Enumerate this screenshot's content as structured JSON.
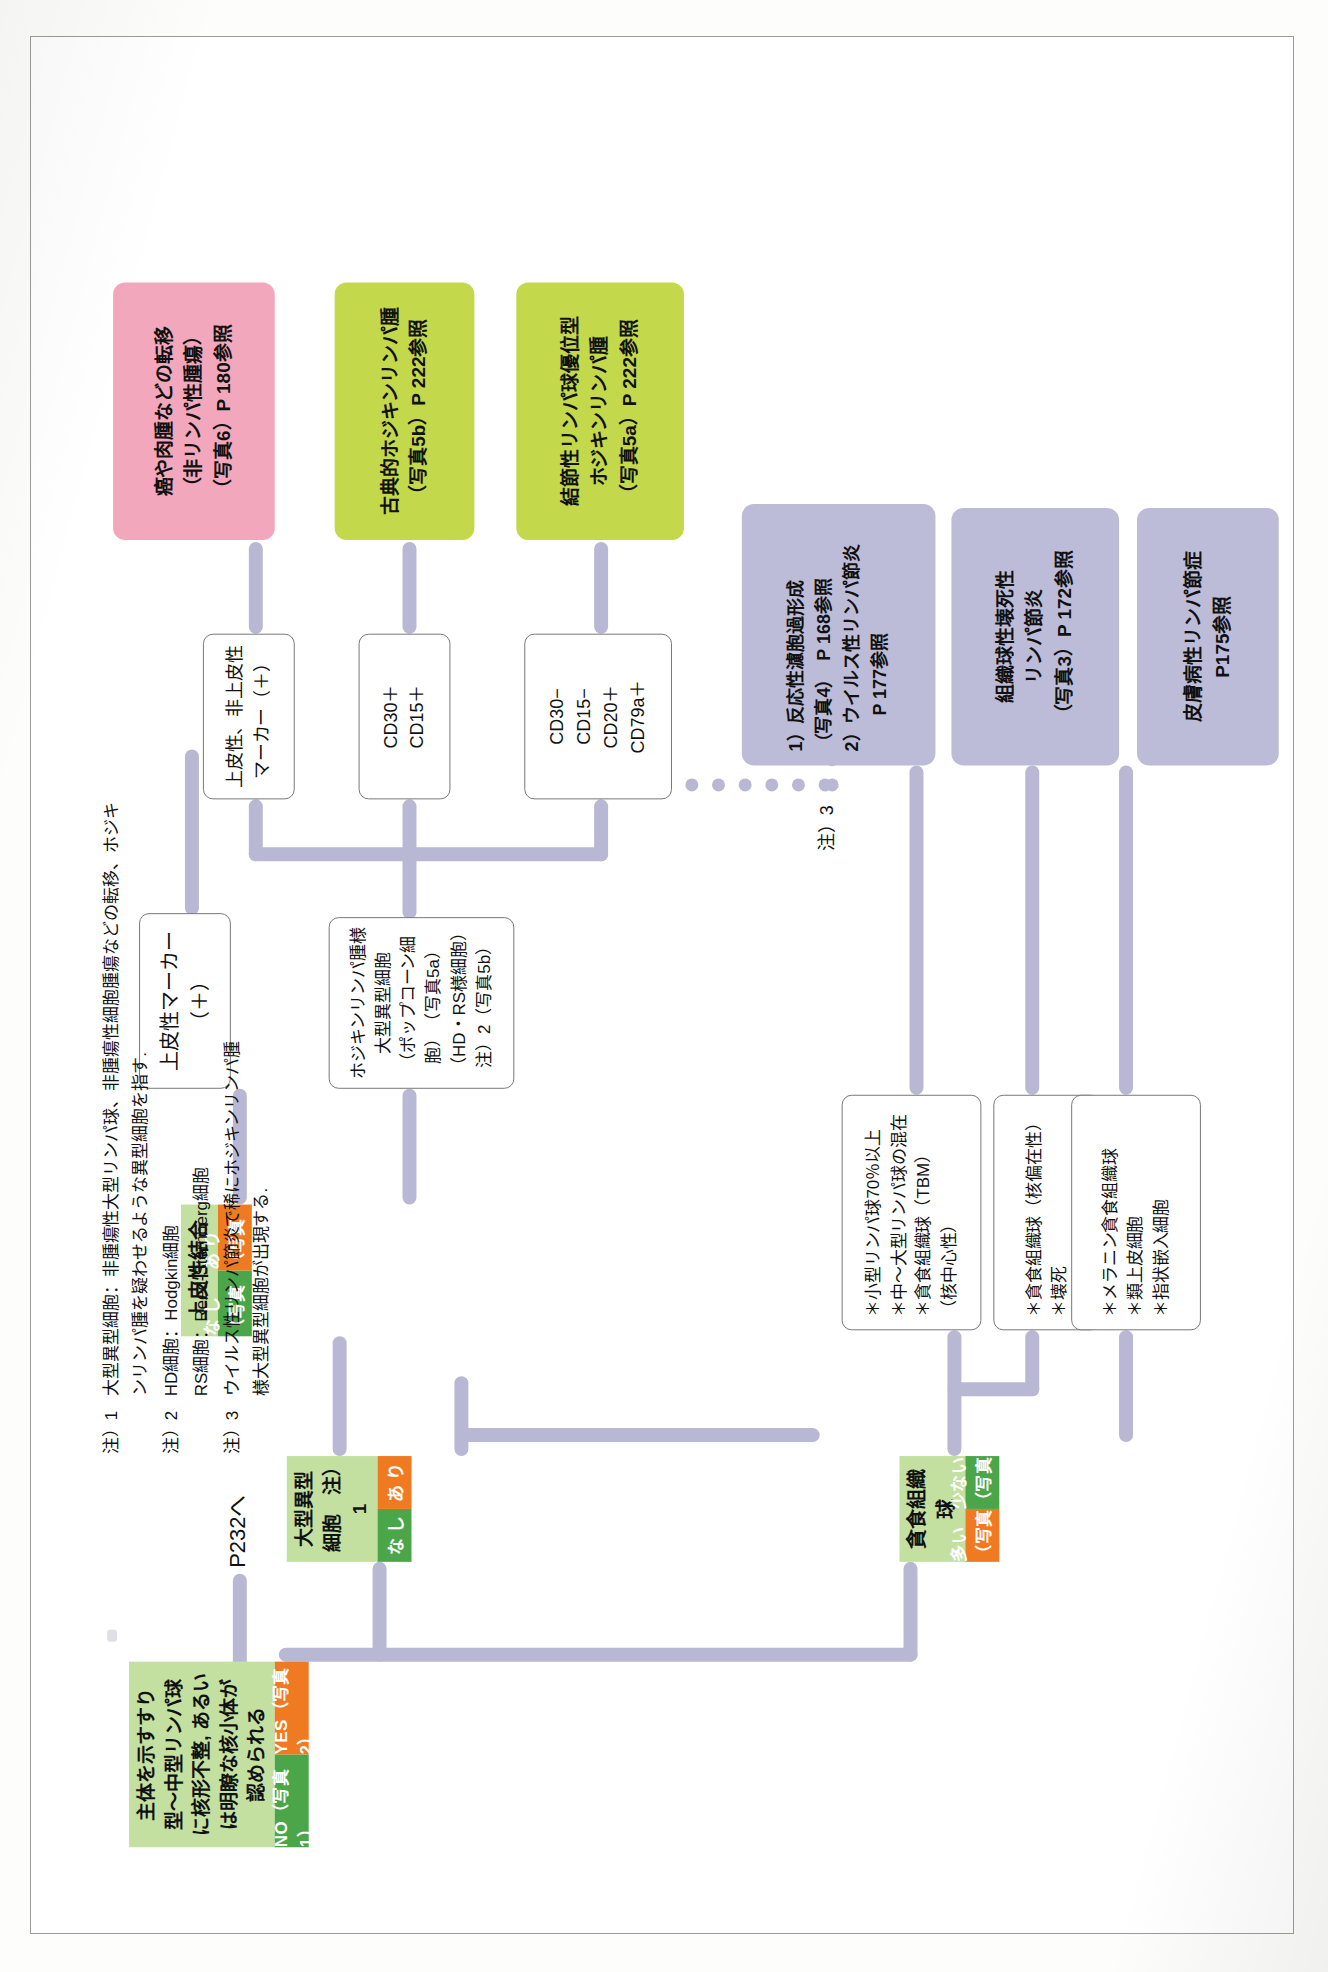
{
  "document": {
    "kind": "diagnostic-flowchart",
    "language": "ja",
    "page_note": "scanned textbook page, chart printed sideways"
  },
  "root": {
    "question": "主体を示すすり型〜中型リンパ球に核形不整,\nあるいは明瞭な核小体が認められる",
    "answer_no": "NO（写真1）",
    "answer_yes": "YES（写真2）",
    "yes_link_text": "P232へ"
  },
  "branch_large_atypical": {
    "title": "大型異型細胞　注）1",
    "answer_none": "な し",
    "answer_some": "あ り"
  },
  "branch_phagocytic": {
    "title": "貪食組織球",
    "answer_many": "多い（写真3）",
    "answer_few": "少ない（写真4）"
  },
  "branch_epithelioid": {
    "title": "上皮性結合",
    "answer_none": "な し（写真5）",
    "answer_some": "あ り（写真6）"
  },
  "criteria_boxes": [
    {
      "id": "melanin",
      "lines": [
        "＊メラニン貪食組織球",
        "＊類上皮細胞",
        "＊指状嵌入細胞"
      ]
    },
    {
      "id": "necrosis",
      "lines": [
        "＊貪食組織球（核偏在性）",
        "＊壊死"
      ]
    },
    {
      "id": "tbm",
      "lines": [
        "＊小型リンパ球70％以上",
        "＊中〜大型リンパ球の混在",
        "＊貪食組織球（TBM）",
        "（核中心性）"
      ]
    },
    {
      "id": "hodgkin-like",
      "lines": [
        "ホジキンリンパ腫様大型異型細胞",
        "（ポップコーン細胞）　（写真5a）",
        "（HD・RS様細胞）　注）2（写真5b）"
      ]
    },
    {
      "id": "epithelial-marker",
      "lines": [
        "上皮性マーカー（＋）"
      ]
    },
    {
      "id": "epi-nonepi-marker",
      "lines": [
        "上皮性、非上皮性",
        "マーカー（＋）"
      ]
    },
    {
      "id": "cd30-cd15",
      "lines": [
        "CD30＋",
        "CD15＋"
      ]
    },
    {
      "id": "cd-panel",
      "lines": [
        "CD30−",
        "CD15−",
        "CD20＋",
        "CD79a＋"
      ]
    }
  ],
  "note3_label": "注）3",
  "terminals": [
    {
      "id": "dermatopathic",
      "color": "#bdbcd8",
      "lines": [
        "皮膚病性リンパ節症",
        "P175参照"
      ]
    },
    {
      "id": "histiocytic-necrotizing",
      "color": "#bdbcd8",
      "lines": [
        "組織球性壊死性",
        "リンパ節炎",
        "（写真3）P 172参照"
      ]
    },
    {
      "id": "reactive-hyperplasia",
      "color": "#bdbcd8",
      "lines": [
        "1）反応性濾胞過形成",
        "（写真4）　P 168参照",
        "2）ウイルス性リンパ節炎",
        "　　P 177参照"
      ]
    },
    {
      "id": "nodular-lymphocyte-predominant",
      "color": "#c3d94b",
      "lines": [
        "結節性リンパ球優位型",
        "ホジキンリンパ腫",
        "（写真5a）P 222参照"
      ]
    },
    {
      "id": "classical-hodgkin",
      "color": "#c3d94b",
      "lines": [
        "古典的ホジキンリンパ腫",
        "（写真5b）P 222参照"
      ]
    },
    {
      "id": "metastasis",
      "color": "#f3a7bd",
      "lines": [
        "癌や肉腫などの転移",
        "（非リンパ性腫瘍）",
        "（写真6）P 180参照"
      ]
    }
  ],
  "notes": [
    {
      "label": "注）1",
      "text": "大型異型細胞：非腫瘍性大型リンパ球、非腫瘍性細胞腫瘍などの転移、ホジキ\nンリンパ腫を疑わせるような異型細胞を指す."
    },
    {
      "label": "注）2",
      "text": "HD細胞：Hodgkin細胞\nRS細胞：Reed-Sternberg細胞"
    },
    {
      "label": "注）3",
      "text": "ウイルス性リンパ節炎で稀にホジキンリンパ腫\n様大型異型細胞が出現する."
    }
  ],
  "notes_flat": {
    "n1_label": "注）1",
    "n1_l1": "大型異型細胞：非腫瘍性大型リンパ球、非腫瘍性細胞腫瘍などの転移、ホジキ",
    "n1_l2": "ンリンパ腫を疑わせるような異型細胞を指す.",
    "n2_label": "注）2",
    "n2_l1": "HD細胞：Hodgkin細胞",
    "n2_l2": "RS細胞：Reed-Sternberg細胞",
    "n3_label": "注）3",
    "n3_l1": "ウイルス性リンパ節炎で稀にホジキンリンパ腫",
    "n3_l2": "様大型異型細胞が出現する."
  },
  "colors": {
    "green_body": "#c3e0a0",
    "green_answer": "#4aa649",
    "orange_answer": "#f07a22",
    "link": "#b9b8d4",
    "terminal_purple": "#bdbcd8",
    "terminal_green": "#c3d94b",
    "terminal_pink": "#f3a7bd"
  }
}
